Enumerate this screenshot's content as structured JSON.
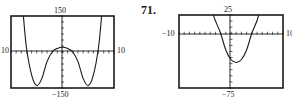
{
  "problem_number": "71.",
  "chart_data": [
    {
      "type": "line",
      "title": "",
      "window": {
        "xmin": -10,
        "xmax": 10,
        "ymin": -150,
        "ymax": 150
      },
      "labels": {
        "top": "150",
        "bottom": "−150",
        "left": "10",
        "right": "10"
      },
      "grid": false,
      "description": "W-shaped quartic: local minima near x=±5 (y≈-140), local max at x=0 (y≈20), x-intercepts near ±2 and ±7",
      "x": [
        -7.6,
        -7,
        -6,
        -5,
        -4,
        -3,
        -2,
        -1,
        0,
        1,
        2,
        3,
        4,
        5,
        6,
        7,
        7.6
      ],
      "y": [
        150,
        20,
        -95,
        -140,
        -110,
        -40,
        0,
        15,
        20,
        15,
        0,
        -40,
        -110,
        -140,
        -95,
        20,
        150
      ]
    },
    {
      "type": "line",
      "title": "",
      "window": {
        "xmin": -10,
        "xmax": 10,
        "ymin": -75,
        "ymax": 25
      },
      "labels": {
        "top": "25",
        "bottom": "−75",
        "left": "−10",
        "right": "10"
      },
      "grid": false,
      "description": "Upward parabola with vertex near (1, -40), x-intercepts near -2 and 4",
      "x": [
        -3.4,
        -3,
        -2,
        -1,
        0,
        1,
        2,
        3,
        4,
        5,
        5.3
      ],
      "y": [
        25,
        17,
        0,
        -23,
        -36,
        -40,
        -36,
        -23,
        0,
        17,
        25
      ]
    }
  ]
}
